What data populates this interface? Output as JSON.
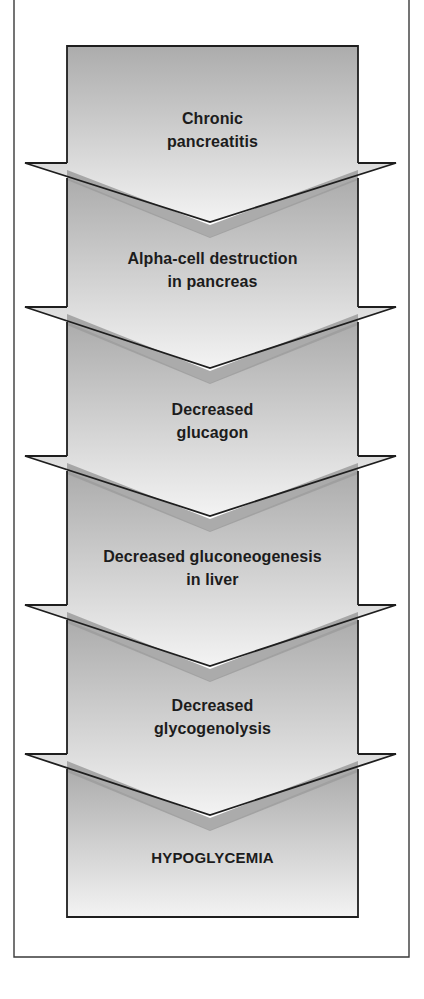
{
  "diagram": {
    "type": "vertical-flowchart",
    "colors": {
      "frame_stroke": "#3a3a3a",
      "box_stroke": "#1e1e1e",
      "fill_dark": "#adadad",
      "fill_light": "#f2f2f2",
      "shadow_band": "#999999",
      "text": "#1c1c1c",
      "background": "#ffffff"
    },
    "steps": [
      {
        "line1": "Chronic",
        "line2": "pancreatitis"
      },
      {
        "line1": "Alpha-cell destruction",
        "line2": "in pancreas"
      },
      {
        "line1": "Decreased",
        "line2": "glucagon"
      },
      {
        "line1": "Decreased gluconeogenesis",
        "line2": "in liver"
      },
      {
        "line1": "Decreased",
        "line2": "glycogenolysis"
      }
    ],
    "outcome": {
      "label": "HYPOGLYCEMIA"
    }
  }
}
